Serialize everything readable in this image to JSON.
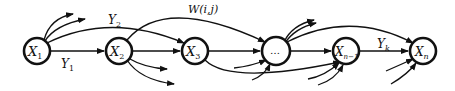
{
  "diagram": {
    "type": "directed-graph",
    "nodes": [
      {
        "id": "x1",
        "label": "X",
        "sub": "1",
        "cx": 37,
        "cy": 51
      },
      {
        "id": "x2",
        "label": "X",
        "sub": "2",
        "cx": 119,
        "cy": 51
      },
      {
        "id": "x3",
        "label": "X",
        "sub": "3",
        "cx": 195,
        "cy": 51
      },
      {
        "id": "dots",
        "label": "…",
        "sub": "",
        "cx": 276,
        "cy": 51
      },
      {
        "id": "xn1",
        "label": "X",
        "sub": "n−1",
        "cx": 346,
        "cy": 51
      },
      {
        "id": "xn",
        "label": "X",
        "sub": "n",
        "cx": 423,
        "cy": 51
      }
    ],
    "edge_labels": {
      "y1": {
        "text": "Y",
        "sub": "1"
      },
      "y2": {
        "text": "Y",
        "sub": "2"
      },
      "w": {
        "text": "W(i,j)"
      },
      "yk": {
        "text": "Y",
        "sub": "k"
      }
    }
  }
}
